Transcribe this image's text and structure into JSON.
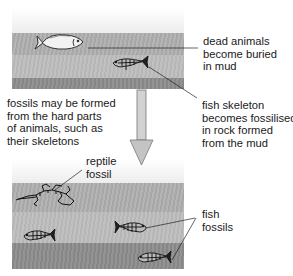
{
  "diagram": {
    "stages": [
      {
        "name": "before",
        "description": "dead animal lying in mud layers"
      },
      {
        "name": "after",
        "description": "fossils preserved in rock layers"
      }
    ],
    "labels": {
      "dead_animals": [
        "dead animals",
        "become buried",
        "in mud"
      ],
      "hard_parts": [
        "fossils may be formed",
        "from the hard parts",
        "of animals, such as",
        "their skeletons"
      ],
      "fish_skeleton": [
        "fish skeleton",
        "becomes fossilised",
        "in rock formed",
        "from the mud"
      ],
      "reptile_fossil": [
        "reptile",
        "fossil"
      ],
      "fish_fossils": [
        "fish",
        "fossils"
      ]
    },
    "arrow": {
      "direction": "down",
      "meaning": "time passes"
    },
    "colors": {
      "mud_light": "#b0b0b0",
      "mud_mid": "#bdbdbd",
      "mud_dark": "#8e8e8e",
      "arrow_fill": "#c8c8c8",
      "line": "#222222"
    }
  }
}
